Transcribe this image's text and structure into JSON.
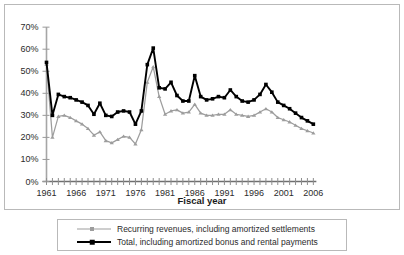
{
  "chart_data": {
    "type": "line",
    "title": "",
    "xlabel": "Fiscal year",
    "ylabel": "",
    "xlim": [
      1961,
      2006
    ],
    "ylim": [
      0,
      70
    ],
    "grid": false,
    "legend_position": "bottom",
    "ytick_labels": [
      "0%",
      "10%",
      "20%",
      "30%",
      "40%",
      "50%",
      "60%",
      "70%"
    ],
    "ytick_values": [
      0,
      10,
      20,
      30,
      40,
      50,
      60,
      70
    ],
    "xtick_labels": [
      "1961",
      "1966",
      "1971",
      "1976",
      "1981",
      "1986",
      "1991",
      "1996",
      "2001",
      "2006"
    ],
    "xtick_values": [
      1961,
      1966,
      1971,
      1976,
      1981,
      1986,
      1991,
      1996,
      2001,
      2006
    ],
    "x": [
      1961,
      1962,
      1963,
      1964,
      1965,
      1966,
      1967,
      1968,
      1969,
      1970,
      1971,
      1972,
      1973,
      1974,
      1975,
      1976,
      1977,
      1978,
      1979,
      1980,
      1981,
      1982,
      1983,
      1984,
      1985,
      1986,
      1987,
      1988,
      1989,
      1990,
      1991,
      1992,
      1993,
      1994,
      1995,
      1996,
      1997,
      1998,
      1999,
      2000,
      2001,
      2002,
      2003,
      2004,
      2005,
      2006
    ],
    "series": [
      {
        "name": "Recurring revenues, including amortized settlements",
        "color": "#9d9d9d",
        "marker": "triangle",
        "values": [
          53.0,
          20.0,
          29.5,
          30.0,
          29.0,
          27.5,
          26.0,
          24.0,
          21.0,
          22.5,
          18.5,
          17.5,
          19.0,
          20.5,
          20.0,
          17.0,
          23.5,
          45.0,
          52.0,
          38.5,
          30.5,
          32.0,
          32.5,
          31.0,
          31.5,
          35.0,
          31.0,
          30.0,
          30.0,
          30.5,
          30.5,
          32.5,
          30.5,
          30.0,
          29.5,
          30.0,
          31.5,
          33.0,
          31.5,
          29.0,
          28.0,
          27.0,
          25.5,
          24.0,
          23.0,
          22.0
        ]
      },
      {
        "name": "Total, including amortized bonus and rental payments",
        "color": "#000000",
        "marker": "square",
        "values": [
          54.0,
          30.0,
          39.5,
          38.5,
          38.0,
          37.0,
          36.0,
          34.5,
          30.5,
          35.5,
          30.0,
          29.5,
          31.5,
          32.0,
          31.5,
          26.0,
          32.0,
          53.0,
          60.5,
          42.5,
          42.0,
          45.0,
          39.0,
          36.5,
          36.5,
          48.0,
          38.5,
          37.0,
          37.5,
          38.5,
          38.0,
          41.5,
          38.5,
          36.5,
          36.0,
          37.0,
          39.5,
          44.0,
          40.5,
          36.0,
          34.5,
          33.0,
          31.0,
          29.0,
          27.5,
          26.0
        ]
      }
    ]
  },
  "legend": {
    "items": [
      {
        "label": "Recurring revenues, including amortized settlements"
      },
      {
        "label": "Total, including amortized bonus and rental payments"
      }
    ]
  }
}
